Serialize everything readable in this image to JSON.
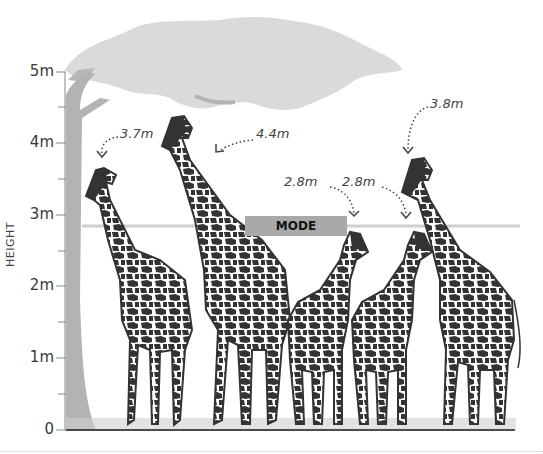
{
  "axis": {
    "label": "HEIGHT",
    "ticks": [
      {
        "label": "0",
        "value": 0
      },
      {
        "label": "1m",
        "value": 1
      },
      {
        "label": "2m",
        "value": 2
      },
      {
        "label": "3m",
        "value": 3
      },
      {
        "label": "4m",
        "value": 4
      },
      {
        "label": "5m",
        "value": 5
      }
    ]
  },
  "mode": {
    "label": "MODE",
    "value": 2.8
  },
  "giraffes": [
    {
      "label": "3.7m",
      "height": 3.7
    },
    {
      "label": "4.4m",
      "height": 4.4
    },
    {
      "label": "2.8m",
      "height": 2.8
    },
    {
      "label": "2.8m",
      "height": 2.8
    },
    {
      "label": "3.8m",
      "height": 3.8
    }
  ],
  "colors": {
    "tree": "#d9d9d9",
    "trunk": "#b3b3b3",
    "giraffe": "#333333",
    "mode_bar": "#a9a9a9",
    "mode_line": "#cfcfcf"
  }
}
